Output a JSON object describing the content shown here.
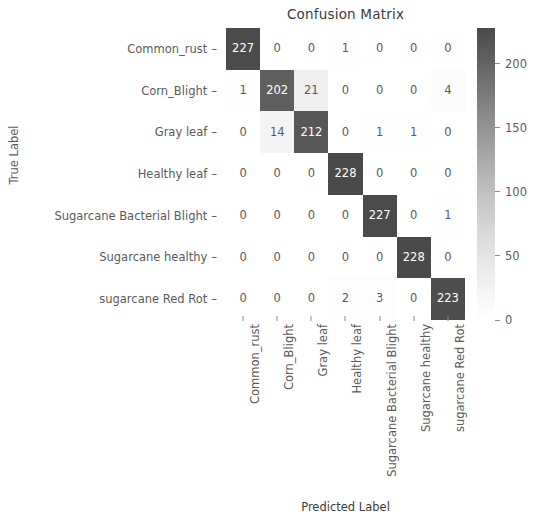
{
  "chart_data": {
    "type": "heatmap",
    "title": "Confusion Matrix",
    "xlabel": "Predicted Label",
    "ylabel": "True Label",
    "categories": [
      "Common_rust",
      "Corn_Blight",
      "Gray leaf",
      "Healthy leaf",
      "Sugarcane Bacterial Blight",
      "Sugarcane healthy",
      "sugarcane Red Rot"
    ],
    "x_tick_labels": [
      "Common_rust",
      "Corn_Blight",
      "Gray leaf",
      "Healthy leaf",
      "Sugarcane Bacterial Blight",
      "Sugarcane healthy",
      "sugarcane Red Rot"
    ],
    "y_tick_labels": [
      "Common_rust",
      "Corn_Blight",
      "Gray leaf",
      "Healthy leaf",
      "Sugarcane Bacterial Blight",
      "Sugarcane healthy",
      "sugarcane Red Rot"
    ],
    "matrix": [
      [
        227,
        0,
        0,
        1,
        0,
        0,
        0
      ],
      [
        1,
        202,
        21,
        0,
        0,
        0,
        4
      ],
      [
        0,
        14,
        212,
        0,
        1,
        1,
        0
      ],
      [
        0,
        0,
        0,
        228,
        0,
        0,
        0
      ],
      [
        0,
        0,
        0,
        0,
        227,
        0,
        1
      ],
      [
        0,
        0,
        0,
        0,
        0,
        228,
        0
      ],
      [
        0,
        0,
        0,
        2,
        3,
        0,
        223
      ]
    ],
    "colormap": "grayscale-reversed",
    "colorbar": {
      "ticks": [
        0,
        50,
        100,
        150,
        200
      ],
      "tick_labels": [
        "0",
        "50",
        "100",
        "150",
        "200"
      ],
      "vmin": 0,
      "vmax": 228,
      "position": "right"
    },
    "grid": false,
    "legend": "colorbar",
    "colors": {
      "high": "#4a4a4a",
      "low": "#ffffff",
      "text_on_dark": "#ffffff",
      "text_on_light": "#5a5a5a",
      "axis_text": "#5a5a5a",
      "title_text": "#3b3b3b"
    }
  }
}
